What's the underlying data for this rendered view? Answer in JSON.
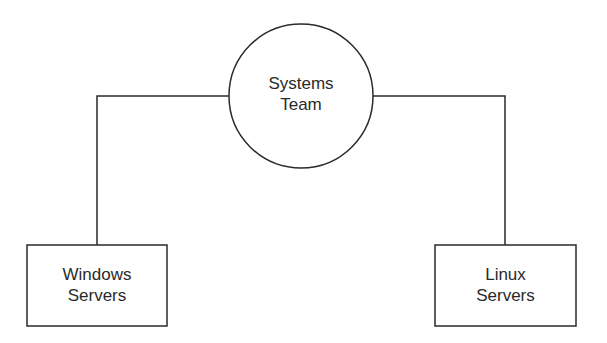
{
  "diagram": {
    "root": {
      "label_line1": "Systems",
      "label_line2": "Team"
    },
    "children": [
      {
        "label_line1": "Windows",
        "label_line2": "Servers"
      },
      {
        "label_line1": "Linux",
        "label_line2": "Servers"
      }
    ],
    "colors": {
      "stroke": "#2a2a2a",
      "background": "#ffffff",
      "text": "#2a2a2a"
    }
  }
}
